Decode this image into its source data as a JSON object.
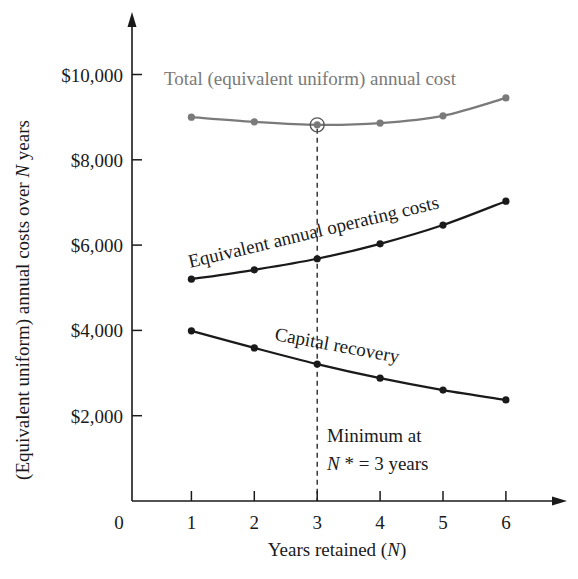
{
  "chart_data": {
    "type": "line",
    "title": "",
    "xlabel": "Years retained (N)",
    "ylabel": "(Equivalent uniform) annual costs over N years",
    "x": [
      1,
      2,
      3,
      4,
      5,
      6
    ],
    "x_ticks": [
      "0",
      "1",
      "2",
      "3",
      "4",
      "5",
      "6"
    ],
    "y_ticks": [
      "$2,000",
      "$4,000",
      "$6,000",
      "$8,000",
      "$10,000"
    ],
    "ylim": [
      0,
      11000
    ],
    "xlim": [
      0,
      6.9
    ],
    "grid": false,
    "legend": "inline labels",
    "series": [
      {
        "name": "Total (equivalent uniform) annual cost",
        "values": [
          9000,
          8890,
          8820,
          8860,
          9030,
          9450
        ],
        "color": "#7a7a7a"
      },
      {
        "name": "Equivalent annual operating costs",
        "values": [
          5200,
          5420,
          5680,
          6030,
          6470,
          7030
        ],
        "color": "#1a1a1a"
      },
      {
        "name": "Capital recovery",
        "values": [
          3990,
          3590,
          3210,
          2880,
          2600,
          2370
        ],
        "color": "#1a1a1a"
      }
    ],
    "annotations": [
      {
        "text": "Minimum at",
        "x": 3
      },
      {
        "text": "N* = 3 years",
        "x": 3
      }
    ],
    "minimum": {
      "x": 3,
      "value": 8820
    }
  },
  "labels": {
    "total": "Total  (equivalent uniform) annual cost",
    "operating": "Equivalent annual operating costs",
    "capital": "Capital recovery",
    "min_line1": "Minimum at",
    "min_line2_N": "N",
    "min_line2_rest": " * = 3 years",
    "xlabel_main": "Years retained  (",
    "xlabel_N": "N",
    "xlabel_close": ")",
    "ylabel_main": "(Equivalent uniform) annual costs over ",
    "ylabel_N": "N",
    "ylabel_end": " years",
    "origin": "0"
  }
}
